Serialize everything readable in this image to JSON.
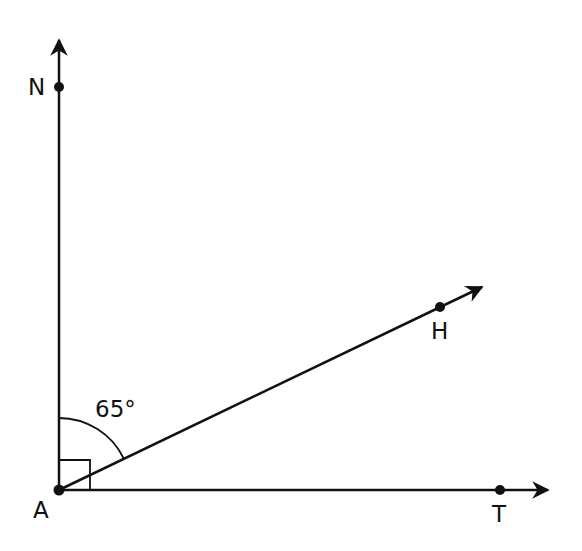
{
  "diagram": {
    "type": "geometry-angles",
    "points": {
      "A": {
        "label": "A"
      },
      "N": {
        "label": "N"
      },
      "H": {
        "label": "H"
      },
      "T": {
        "label": "T"
      }
    },
    "angle_label": "65°",
    "right_angle_marker": "NAT = 90°",
    "rays": [
      "AN",
      "AH",
      "AT"
    ],
    "stroke_color": "#111111"
  }
}
